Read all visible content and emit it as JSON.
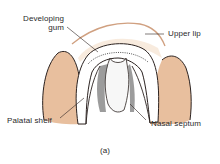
{
  "figure": {
    "caption": "(a)",
    "labels": {
      "developing_gum_line1": "Developing",
      "developing_gum_line2": "gum",
      "upper_lip": "Upper lip",
      "palatal_shelf": "Palatal shelf",
      "nasal_septum": "Nasal septum"
    },
    "colors": {
      "tissue": "#e8bf9e",
      "outline": "#2b2220",
      "lip": "#c8906a",
      "palate": "#ffffff",
      "shading": "#3a3a3a"
    }
  }
}
